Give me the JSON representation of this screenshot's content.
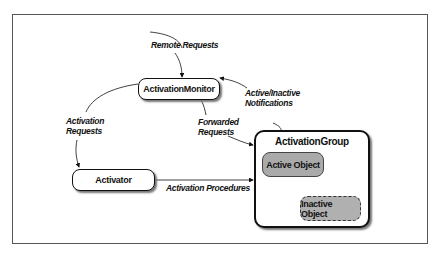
{
  "nodes": {
    "activation_monitor": "ActivationMonitor",
    "activator": "Activator",
    "activation_group": "ActivationGroup",
    "active_object": "Active Object",
    "inactive_object": "Inactive Object"
  },
  "edges": {
    "remote_requests": "Remote Requests",
    "activation_requests_1": "Activation",
    "activation_requests_2": "Requests",
    "forwarded_requests_1": "Forwarded",
    "forwarded_requests_2": "Requests",
    "notifications_1": "Active/Inactive",
    "notifications_2": "Notifications",
    "activation_procedures": "Activation Procedures"
  }
}
